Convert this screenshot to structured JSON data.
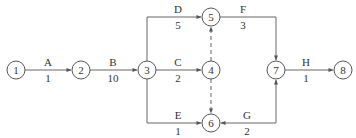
{
  "diagram": {
    "type": "activity-on-arrow network",
    "nodes": [
      {
        "id": "1",
        "label": "1",
        "x": 16,
        "y": 70
      },
      {
        "id": "2",
        "label": "2",
        "x": 81,
        "y": 70
      },
      {
        "id": "3",
        "label": "3",
        "x": 147,
        "y": 70
      },
      {
        "id": "4",
        "label": "4",
        "x": 211,
        "y": 70
      },
      {
        "id": "5",
        "label": "5",
        "x": 211,
        "y": 17
      },
      {
        "id": "6",
        "label": "6",
        "x": 211,
        "y": 123
      },
      {
        "id": "7",
        "label": "7",
        "x": 276,
        "y": 70
      },
      {
        "id": "8",
        "label": "8",
        "x": 343,
        "y": 70
      }
    ],
    "activities": [
      {
        "name": "A",
        "duration": "1",
        "from": "1",
        "to": "2"
      },
      {
        "name": "B",
        "duration": "10",
        "from": "2",
        "to": "3"
      },
      {
        "name": "C",
        "duration": "2",
        "from": "3",
        "to": "4"
      },
      {
        "name": "D",
        "duration": "5",
        "from": "3",
        "to": "5"
      },
      {
        "name": "E",
        "duration": "1",
        "from": "3",
        "to": "6"
      },
      {
        "name": "F",
        "duration": "3",
        "from": "5",
        "to": "7"
      },
      {
        "name": "G",
        "duration": "2",
        "from": "7",
        "to": "6"
      },
      {
        "name": "H",
        "duration": "1",
        "from": "7",
        "to": "8"
      }
    ],
    "dummies": [
      {
        "from": "4",
        "to": "5"
      },
      {
        "from": "4",
        "to": "6"
      }
    ]
  }
}
